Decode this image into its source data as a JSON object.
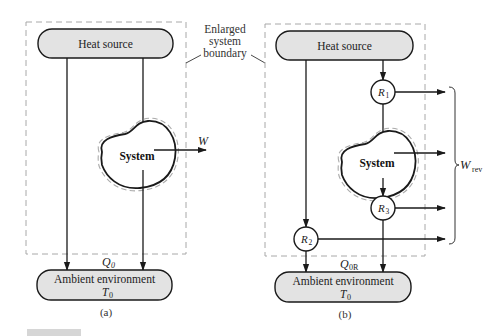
{
  "figure": {
    "colors": {
      "box_fill": "#e3e3e3",
      "stroke": "#1a1a1a",
      "dashed": "#a8a8a8",
      "background": "#ffffff",
      "corner_bar": "#d6d6d6"
    },
    "annotation": {
      "line1": "Enlarged",
      "line2": "system",
      "line3": "boundary"
    },
    "panel_a": {
      "heat_source": "Heat source",
      "system": "System",
      "work": "W",
      "heat_rejected": "Q",
      "heat_rejected_sub": "0",
      "ambient_line1": "Ambient environment",
      "ambient_T": "T",
      "ambient_T_sub": "0",
      "caption": "(a)"
    },
    "panel_b": {
      "heat_source": "Heat source",
      "system": "System",
      "r1": "R",
      "r1_sub": "1",
      "r2": "R",
      "r2_sub": "2",
      "r3": "R",
      "r3_sub": "3",
      "work": "W",
      "work_sub": "rev",
      "heat_rejected": "Q",
      "heat_rejected_sub": "0R",
      "ambient_line1": "Ambient environment",
      "ambient_T": "T",
      "ambient_T_sub": "0",
      "caption": "(b)"
    }
  }
}
